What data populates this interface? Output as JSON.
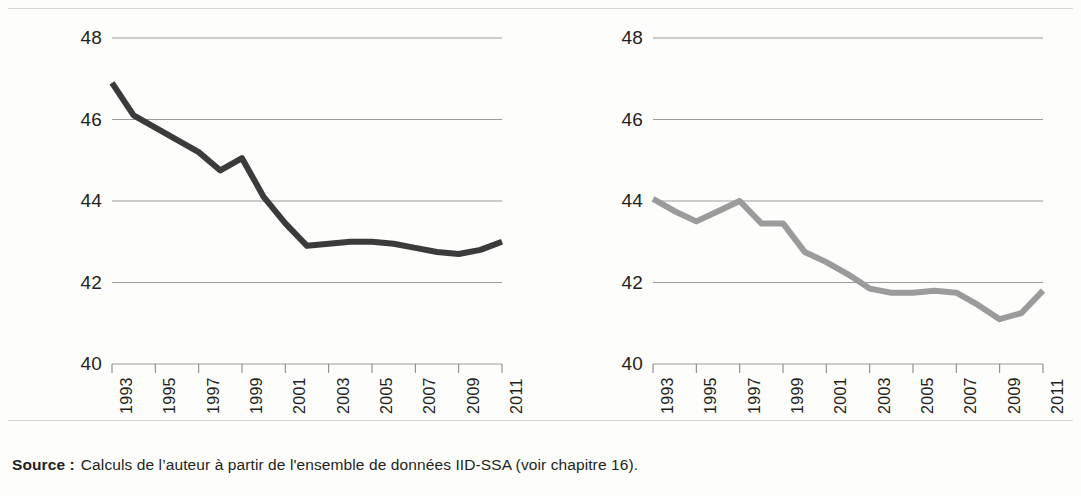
{
  "figure": {
    "background_color": "#fdfdfc",
    "rule_color": "#d9d7d4"
  },
  "source": {
    "label": "Source :",
    "text": "Calculs de l’auteur à partir de l'ensemble de données IID-SSA (voir chapitre 16)."
  },
  "chart_data": [
    {
      "type": "line",
      "panel": "left",
      "title": "",
      "subtitle": "",
      "xlabel": "",
      "ylabel": "",
      "series": [
        {
          "name": "left-series",
          "color": "#3b3b3b",
          "line_width": 6,
          "values": [
            46.9,
            46.1,
            45.8,
            45.5,
            45.2,
            44.75,
            45.05,
            44.1,
            43.45,
            42.9,
            42.95,
            43.0,
            43.0,
            42.95,
            42.85,
            42.75,
            42.7,
            42.8,
            43.0
          ]
        }
      ],
      "x": [
        1993,
        1994,
        1995,
        1996,
        1997,
        1998,
        1999,
        2000,
        2001,
        2002,
        2003,
        2004,
        2005,
        2006,
        2007,
        2008,
        2009,
        2010,
        2011
      ],
      "xlim": [
        1993,
        2011
      ],
      "ylim": [
        40,
        48
      ],
      "yticks": [
        40,
        42,
        44,
        46,
        48
      ],
      "ytick_labels": [
        "40",
        "42",
        "44",
        "46",
        "48"
      ],
      "xticks": [
        1993,
        1995,
        1997,
        1999,
        2001,
        2003,
        2005,
        2007,
        2009,
        2011
      ],
      "xtick_labels": [
        "1993",
        "1995",
        "1997",
        "1999",
        "2001",
        "2003",
        "2005",
        "2007",
        "2009",
        "2011"
      ],
      "grid": true,
      "grid_color": "#9b9b9b",
      "legend": "none"
    },
    {
      "type": "line",
      "panel": "right",
      "title": "",
      "subtitle": "",
      "xlabel": "",
      "ylabel": "",
      "series": [
        {
          "name": "right-series",
          "color": "#9b9b9b",
          "line_width": 6,
          "values": [
            44.05,
            43.75,
            43.5,
            43.75,
            44.0,
            43.45,
            43.45,
            42.75,
            42.5,
            42.2,
            41.85,
            41.75,
            41.75,
            41.8,
            41.75,
            41.45,
            41.1,
            41.25,
            41.8
          ]
        }
      ],
      "x": [
        1993,
        1994,
        1995,
        1996,
        1997,
        1998,
        1999,
        2000,
        2001,
        2002,
        2003,
        2004,
        2005,
        2006,
        2007,
        2008,
        2009,
        2010,
        2011
      ],
      "xlim": [
        1993,
        2011
      ],
      "ylim": [
        40,
        48
      ],
      "yticks": [
        40,
        42,
        44,
        46,
        48
      ],
      "ytick_labels": [
        "40",
        "42",
        "44",
        "46",
        "48"
      ],
      "xticks": [
        1993,
        1995,
        1997,
        1999,
        2001,
        2003,
        2005,
        2007,
        2009,
        2011
      ],
      "xtick_labels": [
        "1993",
        "1995",
        "1997",
        "1999",
        "2001",
        "2003",
        "2005",
        "2007",
        "2009",
        "2011"
      ],
      "grid": true,
      "grid_color": "#9b9b9b",
      "legend": "none"
    }
  ]
}
